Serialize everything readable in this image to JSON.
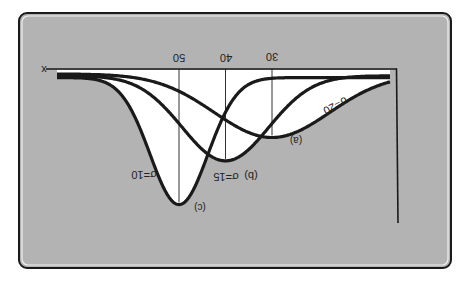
{
  "figure": {
    "orientation": "rotated-180",
    "background_color": "#b3b3b3",
    "card_border_color": "#1a1a1a",
    "curve_color": "#1a1a1a",
    "fill_color": "#ffffff",
    "axis_label_x": "x"
  },
  "chart_data": {
    "type": "line",
    "title": "",
    "xlabel": "x",
    "ylabel": "",
    "grid": false,
    "legend": "inline labels",
    "x_ticks": [
      50,
      40,
      30
    ],
    "tick_labels": [
      "50",
      "40",
      "30"
    ],
    "series": [
      {
        "name": "(a) σ=20",
        "label_id": "(a)",
        "sigma_label": "σ=20",
        "mean": 30,
        "sigma": 20,
        "relative_peak": 0.5
      },
      {
        "name": "(b) σ=15",
        "label_id": "(b)",
        "sigma_label": "σ=15",
        "mean": 40,
        "sigma": 15,
        "relative_peak": 0.67
      },
      {
        "name": "(c) σ=10",
        "label_id": "(c)",
        "sigma_label": "σ=10",
        "mean": 50,
        "sigma": 10,
        "relative_peak": 1.0
      }
    ],
    "annotations": [
      "(a)",
      "σ=20",
      "(b) σ=15",
      "(c)",
      "σ=10",
      "x"
    ]
  }
}
